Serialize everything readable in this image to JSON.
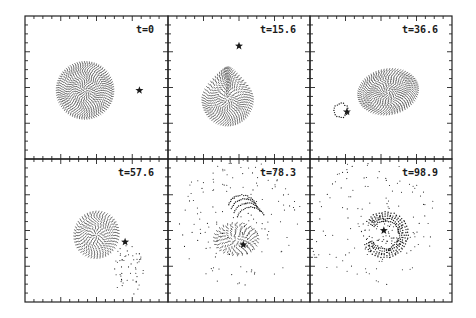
{
  "figure": {
    "ink_color": "#1a1a1a",
    "background_color": "#ffffff",
    "panels": [
      {
        "label": "t=0",
        "time": 0,
        "stage": "sphere",
        "star": [
          0.8,
          0.52
        ]
      },
      {
        "label": "t=15.6",
        "time": 15.6,
        "stage": "teardrop",
        "star": [
          0.5,
          0.21
        ]
      },
      {
        "label": "t=36.6",
        "time": 36.6,
        "stage": "stretched",
        "star": [
          0.26,
          0.67
        ]
      },
      {
        "label": "t=57.6",
        "time": 57.6,
        "stage": "stream",
        "star": [
          0.7,
          0.58
        ]
      },
      {
        "label": "t=78.3",
        "time": 78.3,
        "stage": "disrupted",
        "star": [
          0.53,
          0.6
        ]
      },
      {
        "label": "t=98.9",
        "time": 98.9,
        "stage": "spiral",
        "star": [
          0.52,
          0.5
        ]
      }
    ]
  }
}
